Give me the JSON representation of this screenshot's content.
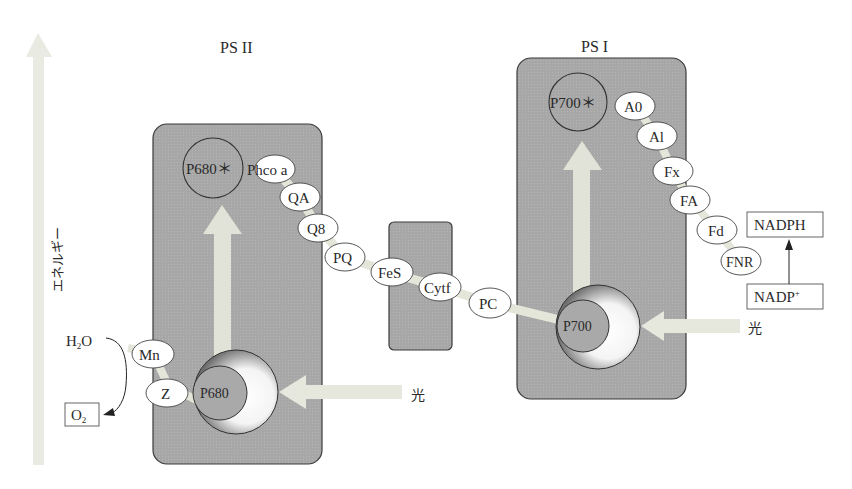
{
  "axis": {
    "label": "エネルギー",
    "direction": "up"
  },
  "photosystems": [
    {
      "id": "psii",
      "label": "PS II",
      "excited_center": "P680＊",
      "ground_center": "P680",
      "carriers": [
        "Phco a",
        "QA",
        "Q8"
      ],
      "donors": [
        "Mn",
        "Z"
      ]
    },
    {
      "id": "psi",
      "label": "PS I",
      "excited_center": "P700＊",
      "ground_center": "P700",
      "carriers": [
        "A0",
        "Al",
        "Fx",
        "FA"
      ]
    }
  ],
  "chain": {
    "between": [
      "PQ",
      "FeS",
      "Cytf",
      "PC"
    ],
    "after_psi": [
      "Fd",
      "FNR"
    ]
  },
  "light": {
    "label": "光"
  },
  "water": {
    "reactant": "H",
    "reactant_sub": "2",
    "reactant_tail": "O",
    "product": "O",
    "product_sub": "2"
  },
  "nadp": {
    "reactant": "NADP",
    "reactant_sup": "+",
    "product": "NADPH"
  },
  "colors": {
    "box_fill": "#a9a9a9",
    "box_stroke": "#3a3a3a",
    "arrow_fill": "#e6e8de",
    "ellipse_fill": "#ffffff"
  }
}
